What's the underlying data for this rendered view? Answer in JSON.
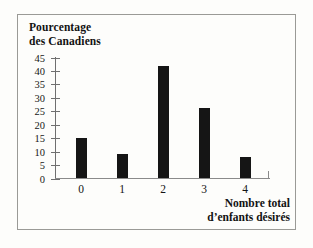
{
  "chart_data": {
    "type": "bar",
    "title": "",
    "ylabel": "Pourcentage\ndes Canadiens",
    "ylabel_line1": "Pourcentage",
    "ylabel_line2": "des Canadiens",
    "xlabel": "Nombre total\nd’enfants désirés",
    "xlabel_line1": "Nombre total",
    "xlabel_line2": "d’enfants désirés",
    "categories": [
      "0",
      "1",
      "2",
      "3",
      "4"
    ],
    "values": [
      15,
      9,
      41.5,
      26,
      8
    ],
    "yticks": [
      "45",
      "40",
      "35",
      "30",
      "25",
      "20",
      "15",
      "10",
      "5",
      "0"
    ],
    "ytick_values": [
      45,
      40,
      35,
      30,
      25,
      20,
      15,
      10,
      5,
      0
    ],
    "ylim": [
      0,
      45
    ],
    "grid": false,
    "legend": false,
    "bar_color": "#151515",
    "axis_color": "#6f6f6f",
    "background_color": "#fdfdfb",
    "border_color": "#9a9a96"
  }
}
